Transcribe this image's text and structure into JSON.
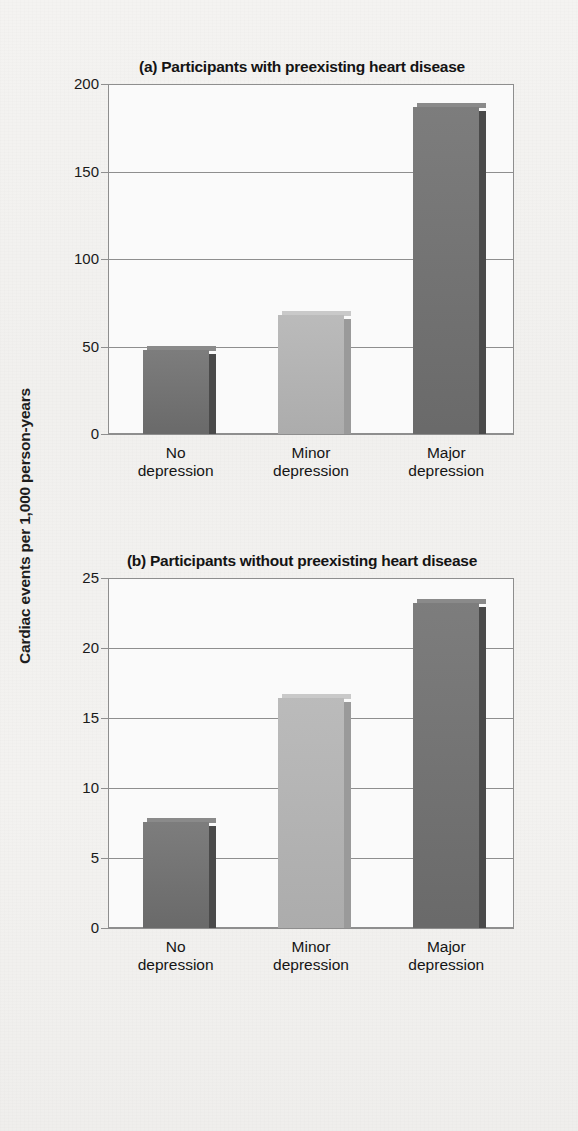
{
  "figure": {
    "y_axis_label": "Cardiac events per 1,000 person-years"
  },
  "panels": [
    {
      "key": "a",
      "title": "(a) Participants with preexisting heart disease",
      "yticks": [
        "200",
        "150",
        "100",
        "50",
        "0"
      ],
      "xlabels": [
        {
          "line1": "No",
          "line2": "depression"
        },
        {
          "line1": "Minor",
          "line2": "depression"
        },
        {
          "line1": "Major",
          "line2": "depression"
        }
      ]
    },
    {
      "key": "b",
      "title": "(b) Participants without preexisting heart disease",
      "yticks": [
        "25",
        "20",
        "15",
        "10",
        "5",
        "0"
      ],
      "xlabels": [
        {
          "line1": "No",
          "line2": "depression"
        },
        {
          "line1": "Minor",
          "line2": "depression"
        },
        {
          "line1": "Major",
          "line2": "depression"
        }
      ]
    }
  ],
  "colors": {
    "bar_dark": "#6e6e6e",
    "bar_dark_side": "#4a4a4a",
    "bar_dark_top": "#8a8a8a",
    "bar_light": "#b3b3b3",
    "bar_light_side": "#9a9a9a",
    "bar_light_top": "#c9c9c9",
    "axis": "#8e8e8e",
    "text": "#141414",
    "page_background": "#f2f1ef",
    "plot_background": "#fafafa"
  },
  "chart_data": [
    {
      "type": "bar",
      "title": "(a) Participants with preexisting heart disease",
      "xlabel": "",
      "ylabel": "Cardiac events per 1,000 person-years",
      "categories": [
        "No depression",
        "Minor depression",
        "Major depression"
      ],
      "values": [
        48,
        68,
        187
      ],
      "bar_colors": [
        "#6e6e6e",
        "#b3b3b3",
        "#6e6e6e"
      ],
      "ylim": [
        0,
        200
      ],
      "yticks": [
        0,
        50,
        100,
        150,
        200
      ],
      "grid": true,
      "legend": "none"
    },
    {
      "type": "bar",
      "title": "(b) Participants without preexisting heart disease",
      "xlabel": "",
      "ylabel": "Cardiac events per 1,000 person-years",
      "categories": [
        "No depression",
        "Minor depression",
        "Major depression"
      ],
      "values": [
        7.6,
        16.4,
        23.2
      ],
      "bar_colors": [
        "#6e6e6e",
        "#b3b3b3",
        "#6e6e6e"
      ],
      "ylim": [
        0,
        25
      ],
      "yticks": [
        0,
        5,
        10,
        15,
        20,
        25
      ],
      "grid": true,
      "legend": "none"
    }
  ]
}
